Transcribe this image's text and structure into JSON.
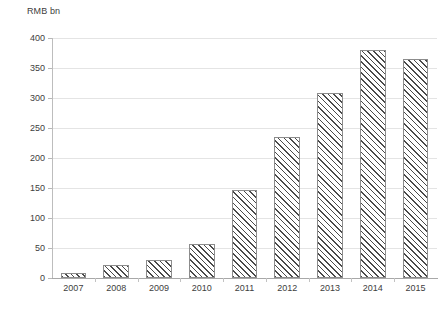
{
  "chart_data": {
    "type": "bar",
    "title": "",
    "subtitle": "",
    "xlabel": "",
    "ylabel": "RMB bn",
    "categories": [
      "2007",
      "2008",
      "2009",
      "2010",
      "2011",
      "2012",
      "2013",
      "2014",
      "2015"
    ],
    "values": [
      9,
      22,
      30,
      57,
      147,
      235,
      308,
      380,
      365
    ],
    "series": [
      {
        "name": "RMB bn",
        "values": [
          9,
          22,
          30,
          57,
          147,
          235,
          308,
          380,
          365
        ]
      }
    ],
    "ylim": [
      0,
      400
    ],
    "ytick_step": 50,
    "ytick_labels": [
      "0",
      "50",
      "100",
      "150",
      "200",
      "250",
      "300",
      "350",
      "400"
    ],
    "ytick_values": [
      0,
      50,
      100,
      150,
      200,
      250,
      300,
      350,
      400
    ],
    "grid": true,
    "grid_axis": "y",
    "legend": false,
    "legend_position": "none",
    "bar_fill": "hatched-diagonal",
    "annotations": []
  },
  "style": {
    "bar_border_color": "#8c8c8c",
    "bar_hatch_color": "#4a4a4a",
    "bar_fill_color": "#ffffff",
    "gridline_color": "#e4e4e4",
    "axis_color": "#a8a8a8",
    "text_color": "#404040",
    "background_color": "#ffffff"
  }
}
